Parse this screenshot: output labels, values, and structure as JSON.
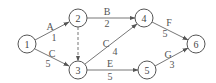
{
  "diagram": {
    "type": "activity-on-arrow network",
    "nodes": [
      {
        "id": "1",
        "label": "1",
        "x": 27,
        "y": 44
      },
      {
        "id": "2",
        "label": "2",
        "x": 78,
        "y": 18
      },
      {
        "id": "3",
        "label": "3",
        "x": 78,
        "y": 70
      },
      {
        "id": "4",
        "label": "4",
        "x": 144,
        "y": 18
      },
      {
        "id": "5",
        "label": "5",
        "x": 147,
        "y": 70
      },
      {
        "id": "6",
        "label": "6",
        "x": 196,
        "y": 44
      }
    ],
    "edges": [
      {
        "from": "1",
        "to": "2",
        "activity": "A",
        "duration": "1",
        "dashed": false
      },
      {
        "from": "1",
        "to": "3",
        "activity": "C",
        "duration": "5",
        "dashed": false
      },
      {
        "from": "2",
        "to": "3",
        "activity": "",
        "duration": "",
        "dashed": true
      },
      {
        "from": "2",
        "to": "4",
        "activity": "B",
        "duration": "2",
        "dashed": false
      },
      {
        "from": "3",
        "to": "4",
        "activity": "C",
        "duration": "4",
        "dashed": false
      },
      {
        "from": "3",
        "to": "5",
        "activity": "E",
        "duration": "5",
        "dashed": false
      },
      {
        "from": "4",
        "to": "6",
        "activity": "F",
        "duration": "5",
        "dashed": false
      },
      {
        "from": "5",
        "to": "6",
        "activity": "G",
        "duration": "3",
        "dashed": false
      }
    ]
  }
}
